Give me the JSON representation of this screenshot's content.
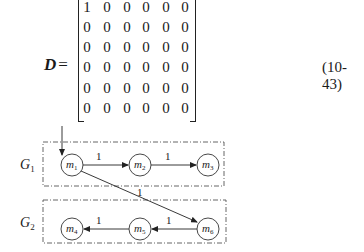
{
  "equation": {
    "lhs": "D",
    "equals": "=",
    "number": "(10-43)",
    "matrix": [
      [
        "1",
        "0",
        "0",
        "0",
        "0",
        "0"
      ],
      [
        "0",
        "0",
        "0",
        "0",
        "0",
        "0"
      ],
      [
        "0",
        "0",
        "0",
        "0",
        "0",
        "0"
      ],
      [
        "0",
        "0",
        "0",
        "0",
        "0",
        "0"
      ],
      [
        "0",
        "0",
        "0",
        "0",
        "0",
        "0"
      ],
      [
        "0",
        "0",
        "0",
        "0",
        "0",
        "0"
      ]
    ]
  },
  "diagram": {
    "groups": [
      {
        "label": "G",
        "sub": "1",
        "nodes": [
          "m1",
          "m2",
          "m3"
        ]
      },
      {
        "label": "G",
        "sub": "2",
        "nodes": [
          "m4",
          "m5",
          "m6"
        ]
      }
    ],
    "nodes": [
      {
        "id": "m1",
        "label": "m",
        "sub": "1"
      },
      {
        "id": "m2",
        "label": "m",
        "sub": "2"
      },
      {
        "id": "m3",
        "label": "m",
        "sub": "3"
      },
      {
        "id": "m4",
        "label": "m",
        "sub": "4"
      },
      {
        "id": "m5",
        "label": "m",
        "sub": "5"
      },
      {
        "id": "m6",
        "label": "m",
        "sub": "6"
      }
    ],
    "edges": [
      {
        "from": "m1",
        "to": "m2",
        "weight": "1"
      },
      {
        "from": "m2",
        "to": "m3",
        "weight": "1"
      },
      {
        "from": "m1",
        "to": "m6",
        "weight": "1"
      },
      {
        "from": "m6",
        "to": "m5",
        "weight": "1"
      },
      {
        "from": "m5",
        "to": "m4",
        "weight": "1"
      }
    ],
    "entry": "m1"
  }
}
